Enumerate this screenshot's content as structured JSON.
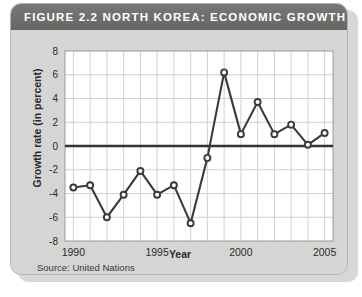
{
  "card": {
    "title": "FIGURE 2.2   NORTH KOREA: ECONOMIC GROWTH",
    "source": "Source: United Nations"
  },
  "chart_data": {
    "type": "line",
    "title": "FIGURE 2.2   NORTH KOREA: ECONOMIC GROWTH",
    "xlabel": "Year",
    "ylabel": "Growth rate (in percent)",
    "xlim": [
      1989.5,
      2005.5
    ],
    "ylim": [
      -8,
      8
    ],
    "yticks": [
      8,
      6,
      4,
      2,
      0,
      -2,
      -4,
      -6,
      -8
    ],
    "ytick_labels": [
      "8",
      "6",
      "4",
      "2",
      "0",
      "-2",
      "-4",
      "-6",
      "-8"
    ],
    "xticks": [
      1990,
      1995,
      2000,
      2005
    ],
    "xtick_labels": [
      "1990",
      "1995",
      "2000",
      "2005"
    ],
    "grid": true,
    "legend": false,
    "zero_line": 0,
    "marker": "open-circle",
    "line_color": "#3a3a3a",
    "plot_bg": "#ffffff",
    "grid_color": "#d0d0d0",
    "x": [
      1990,
      1991,
      1992,
      1993,
      1994,
      1995,
      1996,
      1997,
      1998,
      1999,
      2000,
      2001,
      2002,
      2003,
      2004,
      2005
    ],
    "values": [
      -3.5,
      -3.3,
      -6.0,
      -4.1,
      -2.1,
      -4.1,
      -3.3,
      -6.5,
      -1.0,
      6.2,
      1.0,
      3.7,
      1.0,
      1.8,
      0.1,
      1.1
    ],
    "series": [
      {
        "name": "Growth rate (in percent)",
        "values": [
          -3.5,
          -3.3,
          -6.0,
          -4.1,
          -2.1,
          -4.1,
          -3.3,
          -6.5,
          -1.0,
          6.2,
          1.0,
          3.7,
          1.0,
          1.8,
          0.1,
          1.1
        ]
      }
    ]
  }
}
